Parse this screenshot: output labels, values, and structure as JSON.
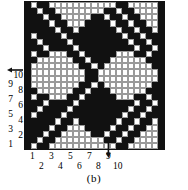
{
  "figure": {
    "caption": "(b)",
    "type": "weaving-draft-grid"
  },
  "axes": {
    "y": {
      "odd_labels": [
        "9",
        "7",
        "5",
        "3",
        "1"
      ],
      "even_labels": [
        "10",
        "8",
        "6",
        "4",
        "2"
      ],
      "arrow_icon": "arrow-left-icon"
    },
    "x": {
      "odd_labels": [
        "1",
        "3",
        "5",
        "7",
        "9"
      ],
      "even_labels": [
        "2",
        "4",
        "6",
        "8",
        "10"
      ],
      "arrow_icon": "arrow-down-icon"
    }
  },
  "colors": {
    "ink": "#111111",
    "paper": "#ffffff",
    "gridline": "#9a9a9a"
  },
  "chart_data": {
    "type": "heatmap",
    "title": "(b)",
    "xlabel": "",
    "ylabel": "",
    "cols": 23,
    "rows": 24,
    "value_legend": {
      "1": "black (filled)",
      "0": "white (empty)"
    },
    "x_tick_labels": [
      "1",
      "2",
      "3",
      "4",
      "5",
      "6",
      "7",
      "8",
      "9",
      "10"
    ],
    "y_tick_labels": [
      "1",
      "2",
      "3",
      "4",
      "5",
      "6",
      "7",
      "8",
      "9",
      "10"
    ],
    "matrix": [
      [
        1,
        0,
        1,
        1,
        0,
        0,
        0,
        0,
        0,
        0,
        0,
        0,
        0,
        0,
        0,
        1,
        1,
        0,
        0,
        0,
        0,
        0,
        1
      ],
      [
        1,
        1,
        0,
        1,
        1,
        0,
        0,
        0,
        0,
        0,
        0,
        0,
        0,
        1,
        1,
        0,
        1,
        1,
        0,
        0,
        0,
        0,
        1
      ],
      [
        1,
        1,
        1,
        0,
        1,
        1,
        0,
        0,
        0,
        0,
        0,
        1,
        1,
        0,
        1,
        1,
        0,
        1,
        1,
        0,
        0,
        0,
        1
      ],
      [
        1,
        1,
        1,
        1,
        0,
        1,
        1,
        0,
        0,
        0,
        1,
        1,
        1,
        1,
        0,
        1,
        1,
        0,
        1,
        1,
        0,
        0,
        1
      ],
      [
        1,
        1,
        1,
        1,
        1,
        0,
        1,
        1,
        0,
        1,
        1,
        1,
        1,
        1,
        1,
        0,
        1,
        1,
        0,
        1,
        1,
        0,
        1
      ],
      [
        1,
        0,
        1,
        1,
        1,
        1,
        0,
        1,
        1,
        1,
        1,
        1,
        1,
        1,
        1,
        1,
        0,
        1,
        1,
        0,
        1,
        1,
        1
      ],
      [
        1,
        1,
        0,
        1,
        1,
        1,
        1,
        0,
        1,
        1,
        1,
        1,
        1,
        1,
        1,
        1,
        1,
        0,
        1,
        1,
        0,
        1,
        1
      ],
      [
        1,
        1,
        1,
        0,
        1,
        1,
        1,
        1,
        0,
        1,
        1,
        1,
        1,
        1,
        1,
        1,
        1,
        1,
        0,
        1,
        1,
        0,
        1
      ],
      [
        1,
        0,
        1,
        1,
        0,
        0,
        0,
        1,
        1,
        0,
        1,
        1,
        1,
        1,
        1,
        0,
        0,
        0,
        1,
        1,
        0,
        1,
        1
      ],
      [
        1,
        1,
        0,
        0,
        0,
        0,
        0,
        0,
        1,
        1,
        0,
        1,
        1,
        1,
        0,
        0,
        0,
        0,
        0,
        0,
        1,
        1,
        1
      ],
      [
        1,
        0,
        0,
        0,
        0,
        0,
        0,
        0,
        0,
        1,
        1,
        0,
        1,
        0,
        0,
        0,
        0,
        0,
        0,
        0,
        0,
        1,
        1
      ],
      [
        1,
        0,
        0,
        0,
        0,
        0,
        0,
        0,
        0,
        0,
        1,
        1,
        0,
        0,
        0,
        0,
        0,
        0,
        0,
        0,
        0,
        0,
        1
      ],
      [
        1,
        0,
        0,
        0,
        0,
        0,
        0,
        0,
        0,
        0,
        1,
        1,
        0,
        0,
        0,
        0,
        0,
        0,
        0,
        0,
        0,
        0,
        1
      ],
      [
        1,
        0,
        0,
        0,
        0,
        0,
        0,
        0,
        0,
        1,
        1,
        0,
        1,
        0,
        0,
        0,
        0,
        0,
        0,
        0,
        0,
        1,
        1
      ],
      [
        1,
        1,
        0,
        0,
        0,
        0,
        0,
        0,
        1,
        1,
        0,
        1,
        1,
        1,
        0,
        0,
        0,
        0,
        0,
        0,
        1,
        1,
        1
      ],
      [
        1,
        0,
        1,
        1,
        0,
        0,
        0,
        1,
        1,
        0,
        1,
        1,
        1,
        1,
        1,
        0,
        0,
        0,
        1,
        1,
        0,
        1,
        1
      ],
      [
        1,
        1,
        1,
        0,
        1,
        1,
        1,
        1,
        0,
        1,
        1,
        1,
        1,
        1,
        1,
        1,
        1,
        1,
        0,
        1,
        1,
        0,
        1
      ],
      [
        1,
        1,
        0,
        1,
        1,
        1,
        1,
        0,
        1,
        1,
        1,
        1,
        1,
        1,
        1,
        1,
        1,
        0,
        1,
        1,
        0,
        1,
        1
      ],
      [
        1,
        0,
        1,
        1,
        1,
        1,
        0,
        1,
        1,
        1,
        1,
        1,
        1,
        1,
        1,
        1,
        0,
        1,
        1,
        0,
        1,
        1,
        1
      ],
      [
        1,
        1,
        1,
        1,
        1,
        0,
        1,
        1,
        0,
        1,
        1,
        1,
        1,
        1,
        1,
        0,
        1,
        1,
        0,
        1,
        1,
        0,
        1
      ],
      [
        1,
        1,
        1,
        1,
        0,
        1,
        1,
        0,
        0,
        0,
        1,
        1,
        1,
        1,
        0,
        1,
        1,
        0,
        1,
        1,
        0,
        0,
        1
      ],
      [
        1,
        1,
        1,
        0,
        1,
        1,
        0,
        0,
        0,
        0,
        0,
        1,
        1,
        0,
        1,
        1,
        0,
        1,
        1,
        0,
        0,
        0,
        1
      ],
      [
        1,
        1,
        0,
        1,
        1,
        0,
        0,
        0,
        0,
        0,
        0,
        0,
        0,
        1,
        1,
        0,
        1,
        1,
        0,
        0,
        0,
        0,
        1
      ],
      [
        1,
        0,
        1,
        1,
        0,
        0,
        0,
        0,
        0,
        0,
        0,
        0,
        0,
        0,
        0,
        1,
        1,
        0,
        0,
        0,
        0,
        0,
        1
      ]
    ]
  }
}
